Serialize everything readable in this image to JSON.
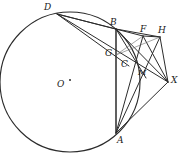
{
  "figure": {
    "type": "geometry-diagram",
    "stroke_color": "#2b2b2b",
    "background_color": "#ffffff",
    "width": 184,
    "height": 158
  },
  "circle": {
    "center_label": "O",
    "center_x": 70,
    "center_y": 82,
    "radius": 70
  },
  "points": [
    {
      "id": "D",
      "label": "D",
      "x": 57,
      "y": 14,
      "label_x": 44,
      "label_y": 3
    },
    {
      "id": "B",
      "label": "B",
      "x": 116,
      "y": 29,
      "label_x": 110,
      "label_y": 18
    },
    {
      "id": "F",
      "label": "F",
      "x": 143,
      "y": 36,
      "label_x": 140,
      "label_y": 25
    },
    {
      "id": "H",
      "label": "H",
      "x": 160,
      "y": 37,
      "label_x": 158,
      "label_y": 26
    },
    {
      "id": "G",
      "label": "G",
      "x": 116,
      "y": 55,
      "label_x": 105,
      "label_y": 49
    },
    {
      "id": "C",
      "label": "C",
      "x": 129,
      "y": 66,
      "label_x": 121,
      "label_y": 60
    },
    {
      "id": "M",
      "label": "M",
      "x": 140,
      "y": 73,
      "label_x": 138,
      "label_y": 68
    },
    {
      "id": "X",
      "label": "X",
      "x": 168,
      "y": 82,
      "label_x": 171,
      "label_y": 76
    },
    {
      "id": "A",
      "label": "A",
      "x": 116,
      "y": 133,
      "label_x": 117,
      "label_y": 136
    },
    {
      "id": "O",
      "label": "O",
      "x": 70,
      "y": 82,
      "label_x": 57,
      "label_y": 80
    }
  ],
  "segments": [
    {
      "name": "D-B",
      "from": "D",
      "to": "B"
    },
    {
      "name": "D-F",
      "from": "D",
      "to": "F"
    },
    {
      "name": "D-X",
      "from": "D",
      "to": "X"
    },
    {
      "name": "D-C",
      "from": "D",
      "to": "C"
    },
    {
      "name": "A-B",
      "from": "A",
      "to": "B"
    },
    {
      "name": "B-X",
      "from": "B",
      "to": "X"
    },
    {
      "name": "B-H",
      "from": "B",
      "to": "H"
    },
    {
      "name": "B-M",
      "from": "B",
      "to": "M"
    },
    {
      "name": "A-F",
      "from": "A",
      "to": "F"
    },
    {
      "name": "A-H",
      "from": "A",
      "to": "H"
    },
    {
      "name": "A-X",
      "from": "A",
      "to": "X"
    },
    {
      "name": "F-H",
      "from": "F",
      "to": "H"
    },
    {
      "name": "F-X",
      "from": "F",
      "to": "X"
    },
    {
      "name": "H-X",
      "from": "H",
      "to": "X"
    },
    {
      "name": "G-F",
      "from": "G",
      "to": "F"
    },
    {
      "name": "G-H",
      "from": "G",
      "to": "H"
    }
  ]
}
